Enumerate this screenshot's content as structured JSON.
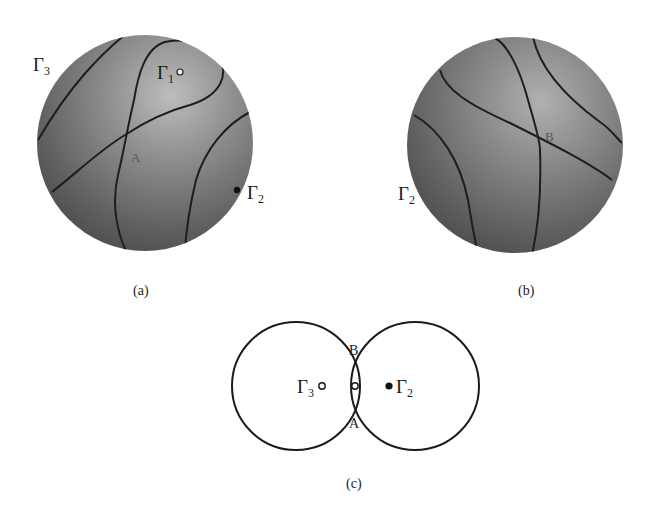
{
  "figure": {
    "panels": [
      {
        "id": "a",
        "caption": "(a)",
        "type": "shaded-sphere",
        "labels": {
          "gamma3": {
            "base": "Γ",
            "sub": "3"
          },
          "gamma1": {
            "base": "Γ",
            "sub": "1"
          },
          "gamma2": {
            "base": "Γ",
            "sub": "2"
          },
          "point": "A"
        }
      },
      {
        "id": "b",
        "caption": "(b)",
        "type": "shaded-sphere",
        "labels": {
          "gamma2": {
            "base": "Γ",
            "sub": "2"
          },
          "point": "B"
        }
      },
      {
        "id": "c",
        "caption": "(c)",
        "type": "two-circle-schematic",
        "labels": {
          "gamma3": {
            "base": "Γ",
            "sub": "3"
          },
          "gamma2": {
            "base": "Γ",
            "sub": "2"
          },
          "top_point": "B",
          "bottom_point": "A"
        },
        "markers": {
          "gamma3": "open-circle",
          "center": "open-circle",
          "gamma2": "filled-circle"
        }
      }
    ],
    "colors": {
      "sphere_dark": "#4a4a4a",
      "sphere_light": "#b8b8b8",
      "curve": "#1e1e1e",
      "ink": "#1a1a1a"
    }
  }
}
